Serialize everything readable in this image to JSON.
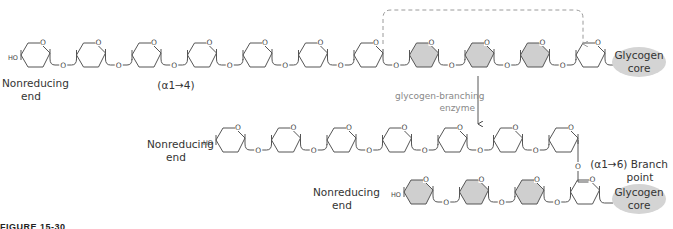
{
  "figure": {
    "caption_partial": "FIGURE 15-30"
  },
  "labels": {
    "top_nonreducing_end_line1": "Nonreducing",
    "top_nonreducing_end_line2": "end",
    "alpha14": "(α1→4)",
    "top_core_line1": "Glycogen",
    "top_core_line2": "core",
    "enzyme_line1": "glycogen-branching",
    "enzyme_line2": "enzyme",
    "mid_nonreducing_end_line1": "Nonreducing",
    "mid_nonreducing_end_line2": "end",
    "branch_line1": "(α1→6) Branch",
    "branch_line2": "point",
    "bottom_nonreducing_end_line1": "Nonreducing",
    "bottom_nonreducing_end_line2": "end",
    "bottom_core_line1": "Glycogen",
    "bottom_core_line2": "core",
    "ho": "HO",
    "o": "O"
  },
  "colors": {
    "line": "#555555",
    "shaded_ring": "#cfcfcf",
    "dashed": "#9a9a9a",
    "core": "#d4d4d4"
  },
  "rows": {
    "top": {
      "ring_count": 11,
      "shaded_indices": [
        7,
        8,
        9
      ]
    },
    "middle": {
      "ring_count": 7,
      "shaded_indices": []
    },
    "bottom": {
      "ring_count": 4,
      "shaded_indices": [
        0,
        1,
        2
      ]
    }
  }
}
